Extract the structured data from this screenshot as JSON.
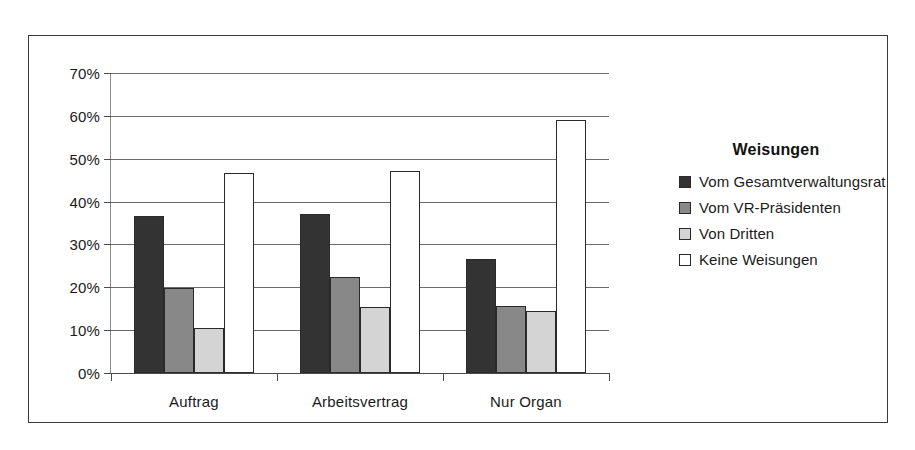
{
  "chart_data": {
    "type": "bar",
    "title": "",
    "xlabel": "",
    "ylabel": "",
    "categories": [
      "Auftrag",
      "Arbeitsvertrag",
      "Nur Organ"
    ],
    "ylim": [
      0,
      70
    ],
    "ytick_labels": [
      "0%",
      "10%",
      "20%",
      "30%",
      "40%",
      "50%",
      "60%",
      "70%"
    ],
    "ytick_values": [
      0,
      10,
      20,
      30,
      40,
      50,
      60,
      70
    ],
    "grid": true,
    "legend_position": "right",
    "legend_title": "Weisungen",
    "series": [
      {
        "name": "Vom Gesamtverwaltungsrat",
        "color": "#333333",
        "values": [
          36.6,
          37.2,
          26.5
        ]
      },
      {
        "name": "Vom VR-Präsidenten",
        "color": "#888888",
        "values": [
          19.8,
          22.5,
          15.6
        ]
      },
      {
        "name": "Von Dritten",
        "color": "#d4d4d4",
        "values": [
          10.5,
          15.5,
          14.4
        ]
      },
      {
        "name": "Keine Weisungen",
        "color": "#ffffff",
        "values": [
          46.7,
          47.1,
          59.0
        ]
      }
    ]
  },
  "figure": {
    "border_color": "#3a3a3a",
    "background": "#ffffff"
  }
}
